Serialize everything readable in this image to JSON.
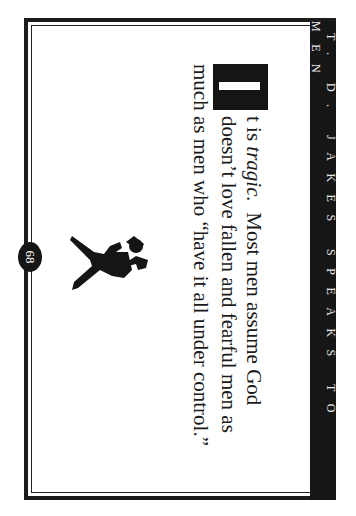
{
  "header": {
    "running_title": "T. D. JAKES SPEAKS TO MEN"
  },
  "body": {
    "drop_cap": "I",
    "line1_prefix": "t is ",
    "line1_italic": "tragic.",
    "line1_rest": "  Most men assume God",
    "line2": "doesn’t love fallen and fearful men as",
    "line3": "much as men who “have it all under control.”"
  },
  "illustration": {
    "icon": "running-man-silhouette-icon"
  },
  "footer": {
    "page_number": "68"
  },
  "colors": {
    "ink": "#161616",
    "paper": "#ffffff"
  }
}
